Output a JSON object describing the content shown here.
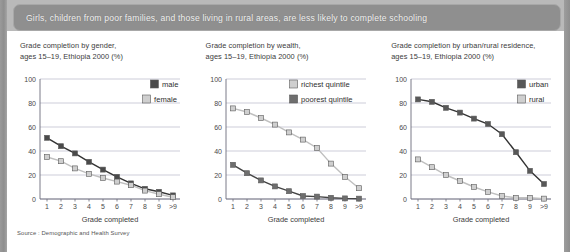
{
  "banner": {
    "title": "Girls, children from poor families, and those living in rural areas, are less likely to complete schooling"
  },
  "source": {
    "text": "Source : Demographic and Health Survey"
  },
  "colors": {
    "dark_marker": "#4a4a4a",
    "light_marker": "#cfcfcf",
    "dark_line": "#333333",
    "light_line": "#bfbfbf",
    "gridline": "#b8b8c8",
    "axis": "#6b6b7a",
    "banner_bg": "#8f8f8f",
    "page_bg": "#b9b9b9",
    "sheet_bg": "#ffffff"
  },
  "chart_data": [
    {
      "type": "line",
      "title": "Grade completion by gender,\nages 15–19, Ethiopia 2000 (%)",
      "xlabel": "Grade completed",
      "ylabel": "",
      "categories": [
        "1",
        "2",
        "3",
        "4",
        "5",
        "6",
        "7",
        "8",
        "9",
        ">9"
      ],
      "ylim": [
        0,
        100
      ],
      "yticks": [
        0,
        20,
        40,
        60,
        80,
        100
      ],
      "grid": true,
      "legend_position": "top-right",
      "series": [
        {
          "name": "male",
          "values": [
            51,
            44,
            38,
            31,
            24.5,
            18.5,
            13,
            8.5,
            6,
            3
          ],
          "marker_color": "#4a4a4a",
          "line_color": "#333333"
        },
        {
          "name": "female",
          "values": [
            35,
            31.5,
            25.5,
            21,
            17.5,
            14.5,
            11.5,
            7,
            4,
            1.5
          ],
          "marker_color": "#cfcfcf",
          "line_color": "#bfbfbf"
        }
      ]
    },
    {
      "type": "line",
      "title": "Grade completion by wealth,\nages 15–19, Ethiopia 2000 (%)",
      "xlabel": "Grade completed",
      "ylabel": "",
      "categories": [
        "1",
        "2",
        "3",
        "4",
        "5",
        "6",
        "7",
        "8",
        "9",
        ">9"
      ],
      "ylim": [
        0,
        100
      ],
      "yticks": [
        0,
        20,
        40,
        60,
        80,
        100
      ],
      "grid": true,
      "legend_position": "top-right",
      "series": [
        {
          "name": "richest quintile",
          "values": [
            75.5,
            72.5,
            67.5,
            62,
            55.5,
            49.5,
            42.5,
            29.5,
            18.5,
            9
          ],
          "marker_color": "#cfcfcf",
          "line_color": "#bfbfbf"
        },
        {
          "name": "poorest quintile",
          "values": [
            28.5,
            21.5,
            15.5,
            10.5,
            6.5,
            2.5,
            2,
            1,
            0.5,
            0.3
          ],
          "marker_color": "#6e6e6e",
          "line_color": "#444444"
        }
      ]
    },
    {
      "type": "line",
      "title": "Grade completion by urban/rural residence,\nages 15–19, Ethiopia 2000 (%)",
      "xlabel": "Grade completed",
      "ylabel": "",
      "categories": [
        "1",
        "2",
        "3",
        "4",
        "5",
        "6",
        "7",
        "8",
        "9",
        ">9"
      ],
      "ylim": [
        0,
        100
      ],
      "yticks": [
        0,
        20,
        40,
        60,
        80,
        100
      ],
      "grid": true,
      "legend_position": "top-right",
      "series": [
        {
          "name": "urban",
          "values": [
            83,
            81,
            76,
            72,
            67,
            62.5,
            54,
            39,
            23.5,
            12.5
          ],
          "marker_color": "#585858",
          "line_color": "#333333"
        },
        {
          "name": "rural",
          "values": [
            33,
            26.5,
            20,
            15,
            10,
            6,
            2.5,
            1,
            1,
            0.3
          ],
          "marker_color": "#cfcfcf",
          "line_color": "#bfbfbf"
        }
      ]
    }
  ]
}
